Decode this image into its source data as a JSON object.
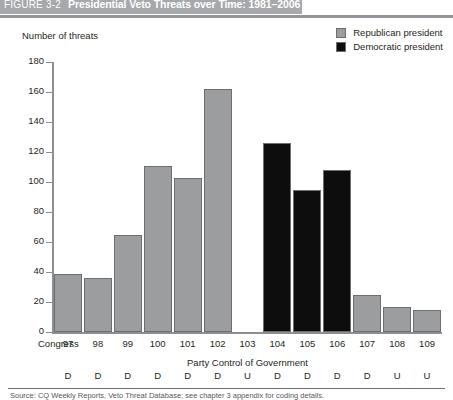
{
  "header": {
    "figure_number": "FIGURE 3-2",
    "title": "Presidential Veto Threats over Time: 1981–2006",
    "band_color": "#a6a8ab"
  },
  "legend": {
    "items": [
      {
        "label": "Republican president",
        "color": "#9b9d9f",
        "icon": "square-swatch-icon"
      },
      {
        "label": "Democratic president",
        "color": "#0d0d0d",
        "icon": "square-swatch-icon"
      }
    ]
  },
  "axes": {
    "y_title": "Number of threats",
    "y_ticks": [
      "180",
      "160",
      "140",
      "120",
      "100",
      "80",
      "60",
      "40",
      "20",
      "0"
    ],
    "congress_caption": "Congress",
    "party_caption": "Party Control of Government"
  },
  "source": {
    "text": "Source: CQ Weekly Reports, Veto Threat Database; see chapter 3 appendix for coding details."
  },
  "chart_data": {
    "type": "bar",
    "title": "Presidential Veto Threats over Time: 1981–2006",
    "xlabel": "Congress",
    "ylabel": "Number of threats",
    "ylim": [
      0,
      180
    ],
    "ytick_interval": 20,
    "grid": false,
    "legend_position": "top-right",
    "categories": [
      "97",
      "98",
      "99",
      "100",
      "101",
      "102",
      "103",
      "104",
      "105",
      "106",
      "107",
      "108",
      "109"
    ],
    "values": [
      39,
      36,
      65,
      111,
      103,
      162,
      0,
      126,
      95,
      108,
      25,
      17,
      15
    ],
    "party_of_president": [
      "Republican",
      "Republican",
      "Republican",
      "Republican",
      "Republican",
      "Republican",
      "Democratic",
      "Democratic",
      "Democratic",
      "Democratic",
      "Republican",
      "Republican",
      "Republican"
    ],
    "party_control_of_government": [
      "D",
      "D",
      "D",
      "D",
      "D",
      "D",
      "U",
      "D",
      "D",
      "D",
      "D",
      "U",
      "U"
    ],
    "series": [
      {
        "name": "Republican president",
        "color": "#9b9d9f"
      },
      {
        "name": "Democratic president",
        "color": "#0d0d0d"
      }
    ]
  }
}
